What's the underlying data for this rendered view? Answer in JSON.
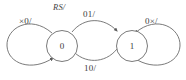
{
  "diagram": {
    "type": "state-transition-diagram",
    "legend": "RS/",
    "states": [
      {
        "id": "s0",
        "label": "0"
      },
      {
        "id": "s1",
        "label": "1"
      }
    ],
    "transitions": [
      {
        "id": "loop-left",
        "from": "s0",
        "to": "s0",
        "label": "×0/",
        "kind": "self-loop",
        "side": "left"
      },
      {
        "id": "arc-top",
        "from": "s0",
        "to": "s1",
        "label": "01/",
        "kind": "arc",
        "side": "top"
      },
      {
        "id": "arc-bottom",
        "from": "s1",
        "to": "s0",
        "label": "10/",
        "kind": "arc",
        "side": "bottom"
      },
      {
        "id": "loop-right",
        "from": "s1",
        "to": "s1",
        "label": "0×/",
        "kind": "self-loop",
        "side": "right"
      }
    ],
    "colors": {
      "stroke": "#6b6b6b",
      "text": "#3a3a3a",
      "background": "#ffffff"
    }
  }
}
